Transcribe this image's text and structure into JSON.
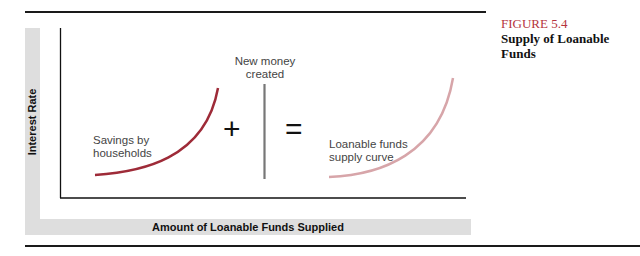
{
  "figure": {
    "label": "FIGURE 5.4",
    "title": "Supply of Loanable Funds",
    "label_color": "#b5343d"
  },
  "axes": {
    "ylabel": "Interest Rate",
    "xlabel": "Amount of Loanable Funds Supplied"
  },
  "elements": {
    "savings_label": "Savings by households",
    "savings_line1": "Savings by",
    "savings_line2": "households",
    "plus": "+",
    "new_money_line1": "New money",
    "new_money_line2": "created",
    "equals": "=",
    "supply_line1": "Loanable funds",
    "supply_line2": "supply curve"
  },
  "colors": {
    "savings_curve": "#9e2b38",
    "supply_curve": "#d7a5a9",
    "new_money_line": "#777777",
    "band": "#dedede"
  }
}
